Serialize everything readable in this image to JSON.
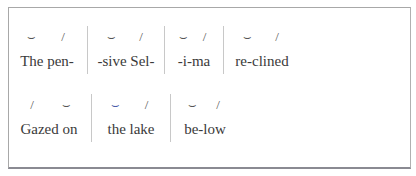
{
  "scansion": {
    "lines": [
      {
        "feet": [
          {
            "marks": [
              "⌣",
              "/"
            ],
            "text": "The pen-"
          },
          {
            "marks": [
              "⌣",
              "/"
            ],
            "text": "-sive Sel-"
          },
          {
            "marks": [
              "⌣",
              "/"
            ],
            "text": "-i-ma"
          },
          {
            "marks": [
              "⌣",
              "/"
            ],
            "text": "re-clined"
          }
        ]
      },
      {
        "feet": [
          {
            "marks": [
              "/",
              "⌣"
            ],
            "text": "Gazed on"
          },
          {
            "marks": [
              "⌣",
              "/"
            ],
            "text": "the lake"
          },
          {
            "marks": [
              "⌣",
              "/"
            ],
            "text": "be-low"
          }
        ]
      }
    ],
    "legend": {
      "unstressed_icon": "breve-icon",
      "stressed_icon": "ictus-icon"
    }
  }
}
